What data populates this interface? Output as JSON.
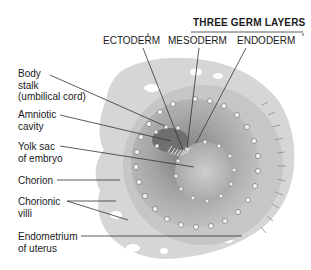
{
  "header": {
    "title": "THREE GERM LAYERS",
    "layers": [
      "ECTODERM",
      "MESODERM",
      "ENDODERM"
    ]
  },
  "labels": [
    {
      "id": "body-stalk",
      "lines": [
        "Body",
        "stalk",
        "(umbilical cord)"
      ]
    },
    {
      "id": "amniotic-cavity",
      "lines": [
        "Amniotic",
        "cavity"
      ]
    },
    {
      "id": "yolk-sac",
      "lines": [
        "Yolk sac",
        "of embryo"
      ]
    },
    {
      "id": "chorion",
      "lines": [
        "Chorion"
      ]
    },
    {
      "id": "chorionic-villi",
      "lines": [
        "Chorionic",
        "villi"
      ]
    },
    {
      "id": "endometrium",
      "lines": [
        "Endometrium",
        "of uterus"
      ]
    }
  ],
  "colors": {
    "tissue_light": "#d2d2d2",
    "tissue_mid": "#b8b8b8",
    "tissue_dark": "#8f8f8f",
    "leader_line": "#333333"
  }
}
